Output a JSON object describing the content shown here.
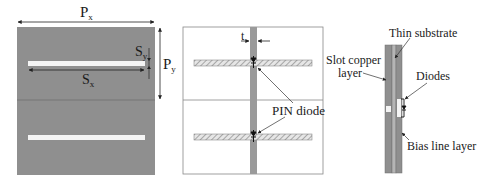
{
  "colors": {
    "metal": "#8f8f8f",
    "metal_dark": "#7f7f7f",
    "slot": "#f4f4f4",
    "outline": "#888888",
    "hatch": "#9a9a9a",
    "text": "#1a1a1a"
  },
  "panel_left": {
    "title": "Unit cell top view (slot layer)",
    "labels": {
      "px": {
        "main": "P",
        "sub": "x"
      },
      "py": {
        "main": "P",
        "sub": "y"
      },
      "sx": {
        "main": "S",
        "sub": "x"
      },
      "sy": {
        "main": "S",
        "sub": "y"
      }
    }
  },
  "panel_middle": {
    "labels": {
      "t": "t",
      "pin_diode": "PIN diode"
    }
  },
  "panel_right": {
    "labels": {
      "thin_substrate": "Thin substrate",
      "slot_copper_line1": "Slot copper",
      "slot_copper_line2": "layer",
      "diodes": "Diodes",
      "bias_line_layer": "Bias line layer"
    }
  }
}
